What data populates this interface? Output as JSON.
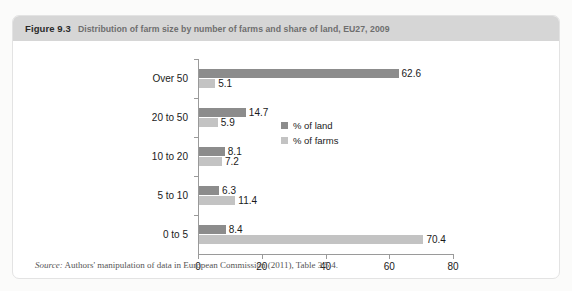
{
  "figure": {
    "number": "Figure 9.3",
    "title": "Distribution of farm size by number of farms and share of land, EU27, 2009",
    "source_label": "Source:",
    "source_text": " Authors' manipulation of data in European Commission (2011), Table 3.5.4."
  },
  "colors": {
    "land": "#8c8c8c",
    "farms": "#c3c3c3",
    "header_band": "#d6d6d6",
    "axis": "#9a9a9a"
  },
  "chart_data": {
    "type": "bar",
    "orientation": "horizontal",
    "title": "Distribution of farm size by number of farms and share of land, EU27, 2009",
    "categories": [
      "0 to 5",
      "5 to 10",
      "10 to 20",
      "20 to 50",
      "Over 50"
    ],
    "series": [
      {
        "name": "% of land",
        "values": [
          8.4,
          6.3,
          8.1,
          14.7,
          62.6
        ]
      },
      {
        "name": "% of farms",
        "values": [
          70.4,
          11.4,
          7.2,
          5.9,
          5.1
        ]
      }
    ],
    "xlabel": "",
    "ylabel": "",
    "xlim": [
      0,
      80
    ],
    "xticks": [
      0,
      20,
      40,
      60,
      80
    ],
    "xtick_labels": [
      "0",
      "20",
      "40",
      "60",
      "80"
    ],
    "grid": false,
    "legend_position": "center-right",
    "data_labels": true
  }
}
